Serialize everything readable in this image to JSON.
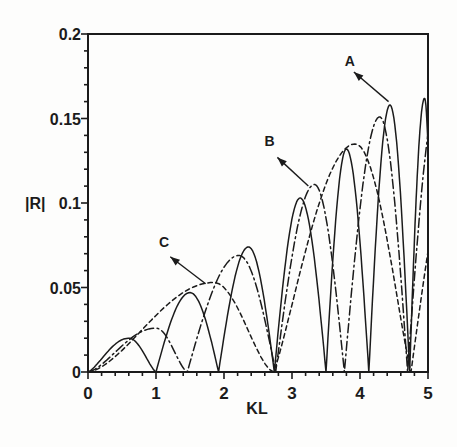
{
  "figure": {
    "kind": "scanned line chart",
    "background": "#fdfdfc",
    "ink_color": "#1b1b1b"
  },
  "chart_data": {
    "type": "line",
    "title": "",
    "xlabel": "KL",
    "ylabel": "|R|",
    "xlim": [
      0,
      5
    ],
    "ylim": [
      0,
      0.2
    ],
    "x_ticks": {
      "values": [
        0,
        1,
        2,
        3,
        4,
        5
      ],
      "labels": [
        "0",
        "1",
        "2",
        "3",
        "4",
        "5"
      ],
      "minor_step": 0.2
    },
    "y_ticks": {
      "values": [
        0,
        0.05,
        0.1,
        0.15,
        0.2
      ],
      "labels": [
        "0",
        "0.05",
        "0.1",
        "0.15",
        "0.2"
      ],
      "minor_step": 0.01
    },
    "grid": false,
    "frame_box": true,
    "legend": "none (curves labeled by arrows A, B, C)",
    "series": [
      {
        "name": "A",
        "style": "solid",
        "description": "oscillating reflection-coefficient curve, lobes between zeros with growing peaks",
        "zeros": [
          0,
          1.0,
          1.92,
          2.74,
          3.5,
          4.13,
          4.73
        ],
        "peaks_x": [
          0.6,
          1.5,
          2.36,
          3.12,
          3.8,
          4.44,
          4.95
        ],
        "peaks_y": [
          0.02,
          0.047,
          0.074,
          0.103,
          0.132,
          0.158,
          0.162
        ],
        "lobes": [
          {
            "x0": 0.0,
            "x1": 1.0,
            "xp": 0.6,
            "yp": 0.02,
            "pow": 1.35
          },
          {
            "x0": 1.0,
            "x1": 1.92,
            "xp": 1.5,
            "yp": 0.047,
            "pow": 1.0
          },
          {
            "x0": 1.92,
            "x1": 2.74,
            "xp": 2.36,
            "yp": 0.074,
            "pow": 1.0
          },
          {
            "x0": 2.74,
            "x1": 3.5,
            "xp": 3.12,
            "yp": 0.103,
            "pow": 1.0
          },
          {
            "x0": 3.5,
            "x1": 4.13,
            "xp": 3.8,
            "yp": 0.132,
            "pow": 1.0
          },
          {
            "x0": 4.13,
            "x1": 4.73,
            "xp": 4.44,
            "yp": 0.158,
            "pow": 1.0
          },
          {
            "x0": 4.73,
            "x1": 5.08,
            "xp": 4.95,
            "yp": 0.162,
            "pow": 1.0
          }
        ]
      },
      {
        "name": "B",
        "style": "dash-dot",
        "description": "oscillating curve with wider lobes than A",
        "zeros": [
          0,
          1.46,
          2.76,
          3.77,
          4.7
        ],
        "peaks_x": [
          1.0,
          2.22,
          3.33,
          4.29
        ],
        "peaks_y": [
          0.026,
          0.069,
          0.111,
          0.151
        ],
        "lobes": [
          {
            "x0": 0.0,
            "x1": 1.46,
            "xp": 1.0,
            "yp": 0.026,
            "pow": 1.5
          },
          {
            "x0": 1.46,
            "x1": 2.76,
            "xp": 2.22,
            "yp": 0.069,
            "pow": 1.0
          },
          {
            "x0": 2.76,
            "x1": 3.77,
            "xp": 3.33,
            "yp": 0.111,
            "pow": 1.0
          },
          {
            "x0": 3.77,
            "x1": 4.7,
            "xp": 4.29,
            "yp": 0.151,
            "pow": 1.0
          },
          {
            "x0": 4.7,
            "x1": 5.62,
            "xp": 5.16,
            "yp": 0.165,
            "pow": 1.0
          }
        ]
      },
      {
        "name": "C",
        "style": "dashed",
        "description": "slowly-rising broad-lobe curve",
        "zeros": [
          0,
          2.73,
          4.75
        ],
        "peaks_x": [
          1.85,
          3.93
        ],
        "peaks_y": [
          0.053,
          0.135
        ],
        "lobes": [
          {
            "x0": 0.0,
            "x1": 2.73,
            "xp": 1.85,
            "yp": 0.053,
            "pow": 1.6
          },
          {
            "x0": 2.73,
            "x1": 4.75,
            "xp": 3.93,
            "yp": 0.135,
            "pow": 1.15
          },
          {
            "x0": 4.75,
            "x1": 6.5,
            "xp": 5.6,
            "yp": 0.16,
            "pow": 1.0
          }
        ]
      }
    ],
    "annotations": [
      {
        "label": "A",
        "label_x": 3.85,
        "label_y": 0.184,
        "arrow_tail_x": 4.42,
        "arrow_tail_y": 0.16,
        "arrow_head_x": 3.91,
        "arrow_head_y": 0.1775
      },
      {
        "label": "B",
        "label_x": 2.67,
        "label_y": 0.1365,
        "arrow_tail_x": 3.24,
        "arrow_tail_y": 0.11,
        "arrow_head_x": 2.785,
        "arrow_head_y": 0.127
      },
      {
        "label": "C",
        "label_x": 1.12,
        "label_y": 0.0771,
        "arrow_tail_x": 1.73,
        "arrow_tail_y": 0.0522,
        "arrow_head_x": 1.21,
        "arrow_head_y": 0.0682
      }
    ]
  }
}
